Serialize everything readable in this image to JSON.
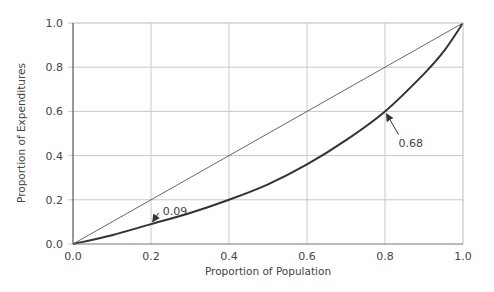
{
  "chart_data": {
    "type": "line",
    "title": "",
    "xlabel": "Proportion of Population",
    "ylabel": "Proportion of Expenditures",
    "xlim": [
      0.0,
      1.0
    ],
    "ylim": [
      0.0,
      1.0
    ],
    "grid": true,
    "x_ticks": [
      "0.0",
      "0.2",
      "0.4",
      "0.6",
      "0.8",
      "1.0"
    ],
    "y_ticks": [
      "0.0",
      "0.2",
      "0.4",
      "0.6",
      "0.8",
      "1.0"
    ],
    "series": [
      {
        "name": "Equality line",
        "style": "thin",
        "color": "#555555",
        "x": [
          0.0,
          1.0
        ],
        "y": [
          0.0,
          1.0
        ]
      },
      {
        "name": "Concentration curve",
        "style": "thick",
        "color": "#333333",
        "x": [
          0.0,
          0.1,
          0.2,
          0.3,
          0.4,
          0.5,
          0.6,
          0.7,
          0.8,
          0.9,
          0.95,
          1.0
        ],
        "y": [
          0.0,
          0.04,
          0.09,
          0.14,
          0.2,
          0.27,
          0.36,
          0.47,
          0.6,
          0.77,
          0.87,
          1.0
        ]
      }
    ],
    "annotations": [
      {
        "text": "0.09",
        "point_x": 0.2,
        "point_y": 0.09,
        "label_x": 0.23,
        "label_y": 0.15
      },
      {
        "text": "0.68",
        "point_x": 0.8,
        "point_y": 0.6,
        "label_x": 0.84,
        "label_y": 0.45
      }
    ]
  }
}
